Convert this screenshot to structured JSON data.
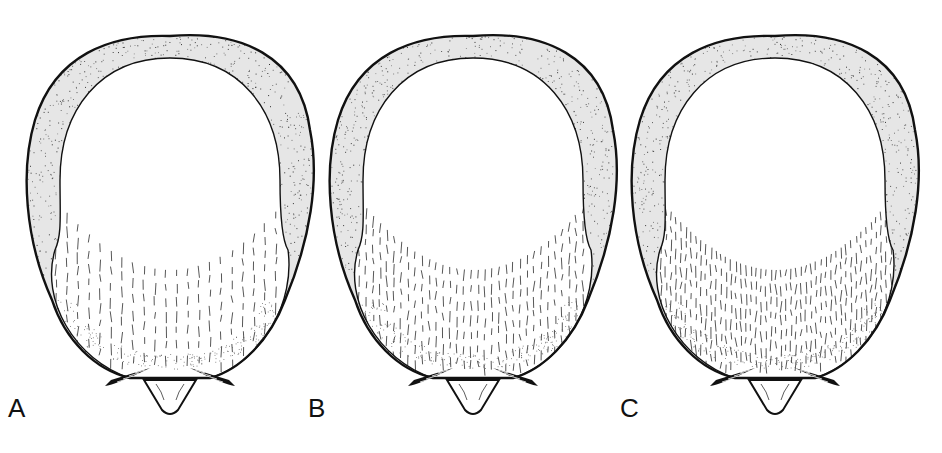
{
  "figure": {
    "type": "scientific-illustration",
    "panels": [
      {
        "label": "A",
        "center_x": 170,
        "hatch_density": "sparse",
        "stipple_color": "#2a2a2a"
      },
      {
        "label": "B",
        "center_x": 473,
        "hatch_density": "medium",
        "stipple_color": "#2a2a2a"
      },
      {
        "label": "C",
        "center_x": 775,
        "hatch_density": "dense",
        "stipple_color": "#2a2a2a"
      }
    ],
    "colors": {
      "outline": "#111111",
      "background": "#ffffff",
      "hatch": "#444444"
    }
  }
}
